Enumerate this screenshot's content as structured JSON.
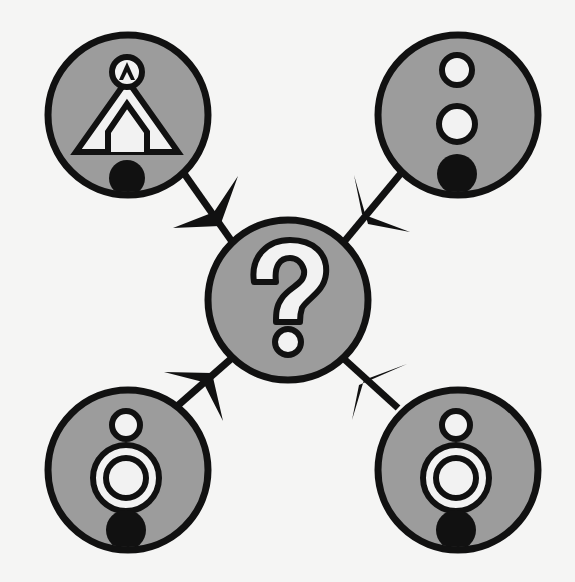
{
  "diagram": {
    "colors": {
      "background": "#f5f5f4",
      "node_fill": "#9c9c9c",
      "stroke": "#111111",
      "inner_fill": "#f2f2f2"
    },
    "center_node": {
      "name": "unknown-node",
      "symbol": "?",
      "icon": "question-mark-icon",
      "cx": 288,
      "cy": 300,
      "r": 80
    },
    "nodes": [
      {
        "id": "top-left",
        "icon": "triangle-house-symbol-icon",
        "description": "Triangle enclosing a house outline, with a small circle containing a triangle on top and a black dot below",
        "cx": 128,
        "cy": 115,
        "r": 81,
        "arrow_direction": "toward-center"
      },
      {
        "id": "top-right",
        "icon": "stacked-circles-symbol-icon",
        "description": "Small open circle, larger open circle, black dot stacked vertically",
        "cx": 458,
        "cy": 115,
        "r": 81,
        "arrow_direction": "toward-center"
      },
      {
        "id": "bottom-left",
        "icon": "ringed-circle-symbol-icon",
        "description": "Small open circle above a double-ringed circle with a black dot below",
        "cx": 128,
        "cy": 470,
        "r": 81,
        "arrow_direction": "toward-center"
      },
      {
        "id": "bottom-right",
        "icon": "ringed-circle-symbol-icon",
        "description": "Small open circle above a double-ringed circle with a black dot below",
        "cx": 458,
        "cy": 470,
        "r": 81,
        "arrow_direction": "toward-center"
      }
    ],
    "edges": [
      {
        "from": "top-left",
        "to": "center",
        "arrowhead": "filled-triangle"
      },
      {
        "from": "top-right",
        "to": "center",
        "arrowhead": "filled-triangle"
      },
      {
        "from": "bottom-left",
        "to": "center",
        "arrowhead": "filled-triangle"
      },
      {
        "from": "bottom-right",
        "to": "center",
        "arrowhead": "filled-triangle"
      }
    ]
  }
}
